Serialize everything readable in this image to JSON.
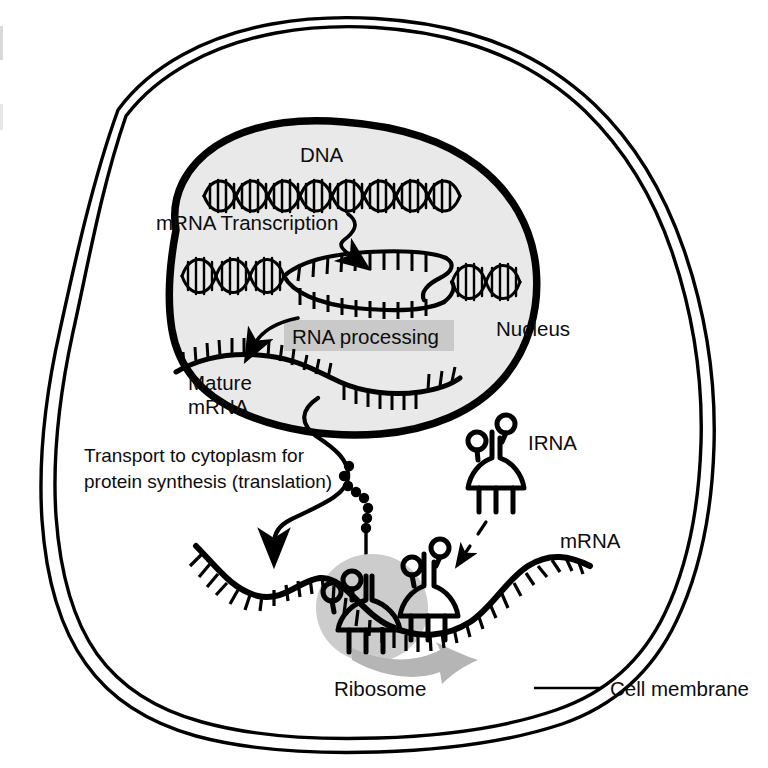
{
  "figure": {
    "title_semantic": "eukaryotic-gene-expression-transcription-translation",
    "background": "#ffffff",
    "ink_color": "#000000",
    "nucleus_fill": "#e9e9e9",
    "highlight_fill": "#c9c9c9",
    "ribosome_fill": "#cccccc",
    "arrow_gray": "#b5b5b5"
  },
  "labels": {
    "dna": "DNA",
    "transcription": "mRNA Transcription",
    "rna_processing": "RNA processing",
    "nucleus": "Nucleus",
    "mature_mrna_line1": "Mature",
    "mature_mrna_line2": "mRNA",
    "transport_line1": "Transport to cytoplasm for",
    "transport_line2": "protein synthesis (translation)",
    "trna": "IRNA",
    "mrna": "mRNA",
    "ribosome": "Ribosome",
    "cell_membrane": "Cell membrane"
  },
  "structures": {
    "cell_membrane": {
      "name": "cell-membrane",
      "style": "double-line irregular closed outline",
      "stroke_width": 3
    },
    "nucleus": {
      "name": "nucleus",
      "style": "thick irregular closed outline, light gray fill",
      "stroke_width": 7
    },
    "dna_helix": {
      "name": "dna-double-helix",
      "turns": 11,
      "location": "top of nucleus"
    },
    "transcription_bubble": {
      "name": "transcription-bubble",
      "description": "DNA strands separated with ladder rungs",
      "helix_turns_left": 3,
      "helix_turns_right": 2
    },
    "pre_mrna": {
      "name": "mature-mrna-strand",
      "description": "wavy single strand with base tick marks",
      "tick_count": 26
    },
    "cytoplasmic_mrna": {
      "name": "cytoplasmic-mrna-strand",
      "description": "long wavy single strand with base tick marks",
      "tick_count": 40
    },
    "ribosome": {
      "name": "ribosome",
      "description": "gray translucent blob straddling mRNA",
      "movement_arrow_direction": "right"
    },
    "trna_bound_count": 2,
    "trna_free_count": 1,
    "polypeptide": {
      "name": "polypeptide-chain",
      "bead_count": 14
    }
  },
  "arrows": [
    {
      "name": "transcription-arrow",
      "from": "dna",
      "to": "transcription-bubble"
    },
    {
      "name": "rna-processing-arrow",
      "from": "transcription-bubble",
      "to": "mature-mrna"
    },
    {
      "name": "transport-arrow",
      "from": "nucleus",
      "to": "cytoplasm"
    },
    {
      "name": "trna-entry-arrow",
      "from": "free-trna",
      "to": "ribosome"
    },
    {
      "name": "ribosome-movement-arrow",
      "from": "ribosome",
      "to": "right"
    }
  ]
}
